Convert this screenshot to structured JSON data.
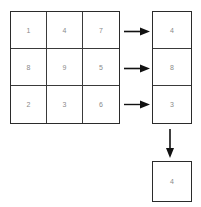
{
  "diagram": {
    "type": "matrix-reduction",
    "stroke_color": "#2b2b2b",
    "grid_line_color": "#3a3a3a",
    "text_color": "#8a8a8a",
    "background_color": "#ffffff"
  },
  "matrix": {
    "name": "source-matrix",
    "rows": 3,
    "cols": 3,
    "values": [
      [
        "1",
        "4",
        "7"
      ],
      [
        "8",
        "9",
        "5"
      ],
      [
        "2",
        "3",
        "6"
      ]
    ]
  },
  "result_column": {
    "name": "reduced-column",
    "rows": 3,
    "cols": 1,
    "values": [
      "4",
      "8",
      "3"
    ]
  },
  "final": {
    "name": "final-result",
    "value": "4"
  },
  "arrows": {
    "row_arrows": [
      {
        "name": "row-1-arrow",
        "direction": "right"
      },
      {
        "name": "row-2-arrow",
        "direction": "right"
      },
      {
        "name": "row-3-arrow",
        "direction": "right"
      }
    ],
    "column_arrow": {
      "name": "column-arrow",
      "direction": "down"
    }
  }
}
